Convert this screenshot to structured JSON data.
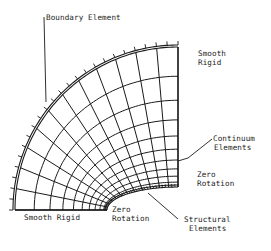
{
  "diagram": {
    "type": "finite-element mesh (quarter annulus with elliptical inner opening)",
    "colors": {
      "line": "#1a1a1a",
      "background": "#ffffff"
    },
    "geometry": {
      "center": [
        178,
        210
      ],
      "outer_radius": 163,
      "inner_semi_axes": [
        71,
        23
      ],
      "angular_divisions": 12,
      "radial_divisions": 10,
      "grading": 1.22
    },
    "labels": {
      "boundary_element": "Boundary Element",
      "smooth_rigid_right_1": "Smooth",
      "smooth_rigid_right_2": "Rigid",
      "continuum_1": "Continuum",
      "continuum_2": "Elements",
      "zero_rotation_right_1": "Zero",
      "zero_rotation_right_2": "Rotation",
      "smooth_rigid_bottom": "Smooth Rigid",
      "zero_rotation_bottom_1": "Zero",
      "zero_rotation_bottom_2": "Rotation",
      "structural_1": "Structural",
      "structural_2": "Elements"
    }
  }
}
